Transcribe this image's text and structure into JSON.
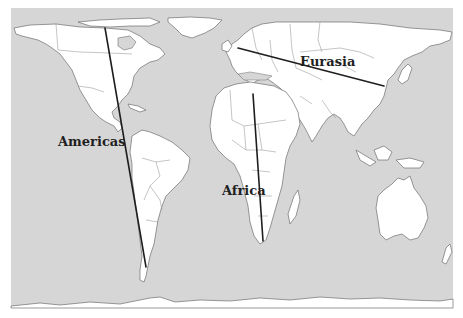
{
  "map": {
    "title": "",
    "projection": "world map",
    "colors": {
      "ocean": "#d6d6d6",
      "land": "#ffffff",
      "coast": "#6e6e6e",
      "axis_line": "#1e1e1e",
      "label": "#1f1f1f"
    },
    "labels": [
      {
        "id": "americas",
        "text": "Americas",
        "x": 58,
        "y": 146
      },
      {
        "id": "eurasia",
        "text": "Eurasia",
        "x": 300,
        "y": 66
      },
      {
        "id": "africa",
        "text": "Africa",
        "x": 222,
        "y": 195
      }
    ],
    "axes": [
      {
        "id": "americas-axis",
        "orientation": "north-south",
        "x1": 105,
        "y1": 28,
        "x2": 146,
        "y2": 267
      },
      {
        "id": "eurasia-axis",
        "orientation": "east-west",
        "x1": 238,
        "y1": 48,
        "x2": 384,
        "y2": 86
      },
      {
        "id": "africa-axis",
        "orientation": "north-south",
        "x1": 253,
        "y1": 94,
        "x2": 263,
        "y2": 241
      }
    ]
  }
}
